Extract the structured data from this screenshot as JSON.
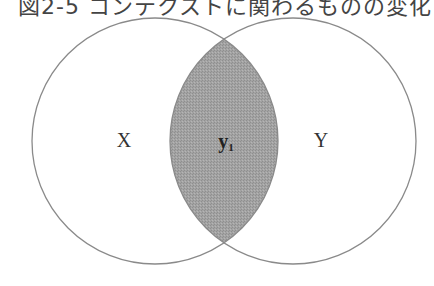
{
  "figure": {
    "title": "図2-5 コンテクストに関わるものの変化",
    "sets": [
      {
        "id": "X",
        "label": "X",
        "cx": 155,
        "cy": 141,
        "r": 123
      },
      {
        "id": "Y",
        "label": "Y",
        "cx": 293,
        "cy": 141,
        "r": 123
      }
    ],
    "intersection": {
      "label_main": "y",
      "label_sub": "1",
      "fill_color": "#a0a0a0"
    },
    "stroke_color": "#8a8a8a",
    "background": "#ffffff"
  }
}
